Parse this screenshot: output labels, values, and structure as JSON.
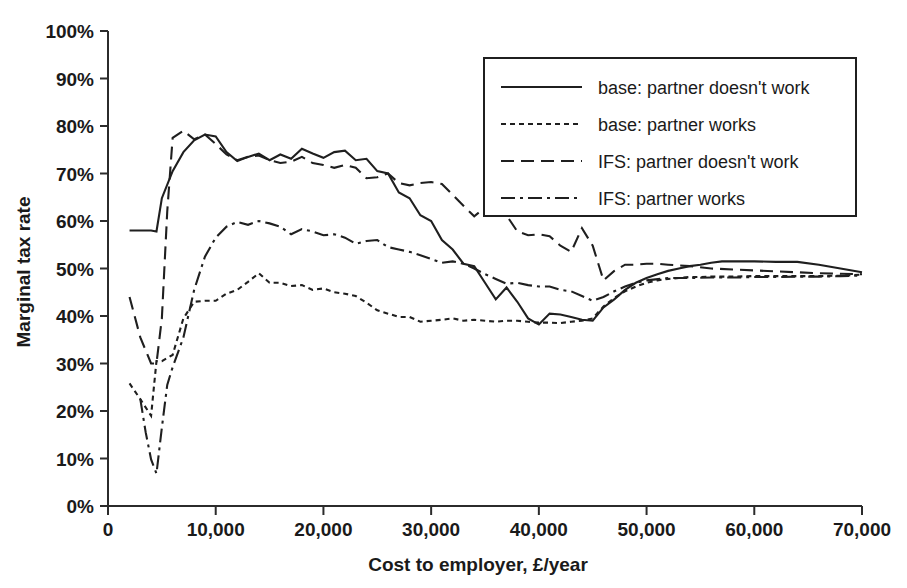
{
  "chart_data": {
    "type": "line",
    "title": "",
    "xlabel": "Cost to employer, £/year",
    "ylabel": "Marginal tax rate",
    "xlim": [
      0,
      70000
    ],
    "ylim": [
      0,
      1.0
    ],
    "grid": false,
    "legend_position": "top-right",
    "x_ticks": [
      0,
      10000,
      20000,
      30000,
      40000,
      50000,
      60000,
      70000
    ],
    "x_tick_labels": [
      "0",
      "10,000",
      "20,000",
      "30,000",
      "40,000",
      "50,000",
      "60,000",
      "70,000"
    ],
    "y_ticks": [
      0,
      0.1,
      0.2,
      0.3,
      0.4,
      0.5,
      0.6,
      0.7,
      0.8,
      0.9,
      1.0
    ],
    "y_tick_labels": [
      "0%",
      "10%",
      "20%",
      "30%",
      "40%",
      "50%",
      "60%",
      "70%",
      "80%",
      "90%",
      "100%"
    ],
    "series": [
      {
        "name": "base: partner doesn't work",
        "dash_style": "solid",
        "dash_array": "",
        "x": [
          2000,
          3000,
          4000,
          4500,
          5000,
          6000,
          7000,
          8000,
          9000,
          10000,
          11000,
          12000,
          13000,
          14000,
          15000,
          16000,
          17000,
          18000,
          19000,
          20000,
          21000,
          22000,
          23000,
          24000,
          25000,
          26000,
          27000,
          28000,
          29000,
          30000,
          31000,
          32000,
          33000,
          34000,
          35000,
          36000,
          37000,
          38000,
          39000,
          40000,
          41000,
          42000,
          43000,
          44000,
          45000,
          46000,
          47000,
          48000,
          49000,
          50000,
          51000,
          52000,
          53000,
          54000,
          55000,
          56000,
          57000,
          58000,
          60000,
          62000,
          64000,
          66000,
          68000,
          70000
        ],
        "y": [
          0.58,
          0.58,
          0.58,
          0.578,
          0.648,
          0.705,
          0.745,
          0.77,
          0.782,
          0.778,
          0.745,
          0.726,
          0.735,
          0.742,
          0.728,
          0.74,
          0.731,
          0.752,
          0.742,
          0.733,
          0.745,
          0.748,
          0.728,
          0.731,
          0.705,
          0.7,
          0.66,
          0.648,
          0.612,
          0.6,
          0.56,
          0.54,
          0.51,
          0.505,
          0.47,
          0.435,
          0.46,
          0.43,
          0.395,
          0.382,
          0.405,
          0.403,
          0.398,
          0.392,
          0.39,
          0.418,
          0.435,
          0.455,
          0.47,
          0.48,
          0.488,
          0.495,
          0.5,
          0.505,
          0.508,
          0.512,
          0.515,
          0.515,
          0.515,
          0.514,
          0.514,
          0.508,
          0.5,
          0.492
        ]
      },
      {
        "name": "base: partner works",
        "dash_style": "dotted",
        "dash_array": "5,4",
        "x": [
          2000,
          3000,
          4000,
          4500,
          5000,
          6000,
          7000,
          8000,
          9000,
          10000,
          11000,
          12000,
          13000,
          14000,
          15000,
          16000,
          17000,
          18000,
          19000,
          20000,
          21000,
          22000,
          23000,
          24000,
          25000,
          26000,
          27000,
          28000,
          29000,
          30000,
          31000,
          32000,
          33000,
          34000,
          35000,
          36000,
          37000,
          38000,
          39000,
          40000,
          41000,
          42000,
          43000,
          44000,
          45000,
          46000,
          47000,
          48000,
          49000,
          50000,
          51000,
          52000,
          53000,
          54000,
          55000,
          56000,
          58000,
          60000,
          62000,
          64000,
          66000,
          68000,
          70000
        ],
        "y": [
          0.258,
          0.225,
          0.19,
          0.305,
          0.305,
          0.318,
          0.395,
          0.43,
          0.432,
          0.432,
          0.447,
          0.455,
          0.472,
          0.49,
          0.47,
          0.47,
          0.463,
          0.465,
          0.455,
          0.458,
          0.45,
          0.447,
          0.442,
          0.428,
          0.412,
          0.405,
          0.398,
          0.398,
          0.388,
          0.39,
          0.392,
          0.395,
          0.39,
          0.392,
          0.39,
          0.388,
          0.39,
          0.39,
          0.388,
          0.386,
          0.386,
          0.385,
          0.388,
          0.39,
          0.395,
          0.42,
          0.438,
          0.452,
          0.462,
          0.47,
          0.475,
          0.478,
          0.48,
          0.482,
          0.482,
          0.483,
          0.483,
          0.484,
          0.484,
          0.484,
          0.484,
          0.485,
          0.487
        ]
      },
      {
        "name": "IFS: partner doesn't work",
        "dash_style": "dashed",
        "dash_array": "13,7",
        "x": [
          2000,
          3000,
          4000,
          4500,
          5000,
          5500,
          6000,
          7000,
          8000,
          9000,
          10000,
          11000,
          12000,
          13000,
          14000,
          15000,
          16000,
          17000,
          18000,
          19000,
          20000,
          21000,
          22000,
          23000,
          24000,
          25000,
          26000,
          27000,
          28000,
          29000,
          30000,
          31000,
          32000,
          33000,
          34000,
          35000,
          36000,
          37000,
          38000,
          39000,
          40000,
          41000,
          42000,
          43000,
          44000,
          45000,
          46000,
          47000,
          48000,
          49000,
          50000,
          51000,
          52000,
          54000,
          56000,
          58000,
          60000,
          62000,
          64000,
          66000,
          68000,
          70000
        ],
        "y": [
          0.44,
          0.355,
          0.3,
          0.3,
          0.395,
          0.62,
          0.775,
          0.79,
          0.772,
          0.782,
          0.762,
          0.74,
          0.728,
          0.735,
          0.738,
          0.728,
          0.722,
          0.725,
          0.735,
          0.722,
          0.718,
          0.712,
          0.718,
          0.712,
          0.69,
          0.692,
          0.7,
          0.68,
          0.675,
          0.68,
          0.682,
          0.678,
          0.655,
          0.632,
          0.61,
          0.628,
          0.648,
          0.612,
          0.578,
          0.57,
          0.572,
          0.568,
          0.548,
          0.535,
          0.585,
          0.548,
          0.475,
          0.495,
          0.508,
          0.508,
          0.51,
          0.51,
          0.508,
          0.505,
          0.5,
          0.498,
          0.496,
          0.494,
          0.492,
          0.49,
          0.489,
          0.488
        ]
      },
      {
        "name": "IFS: partner works",
        "dash_style": "dashdot",
        "dash_array": "14,5,3,5",
        "x": [
          3000,
          3500,
          4000,
          4500,
          5000,
          5500,
          6000,
          7000,
          8000,
          9000,
          10000,
          11000,
          12000,
          13000,
          14000,
          15000,
          16000,
          17000,
          18000,
          19000,
          20000,
          21000,
          22000,
          23000,
          24000,
          25000,
          26000,
          27000,
          28000,
          29000,
          30000,
          31000,
          32000,
          33000,
          34000,
          35000,
          36000,
          37000,
          38000,
          39000,
          40000,
          41000,
          42000,
          43000,
          44000,
          45000,
          46000,
          47000,
          48000,
          49000,
          50000,
          52000,
          54000,
          56000,
          58000,
          60000,
          62000,
          64000,
          66000,
          68000,
          70000
        ],
        "y": [
          0.225,
          0.155,
          0.098,
          0.068,
          0.165,
          0.255,
          0.292,
          0.355,
          0.455,
          0.525,
          0.565,
          0.588,
          0.598,
          0.592,
          0.6,
          0.595,
          0.588,
          0.572,
          0.583,
          0.578,
          0.57,
          0.572,
          0.565,
          0.552,
          0.558,
          0.56,
          0.545,
          0.54,
          0.535,
          0.528,
          0.52,
          0.512,
          0.515,
          0.51,
          0.5,
          0.488,
          0.478,
          0.468,
          0.47,
          0.465,
          0.462,
          0.462,
          0.455,
          0.452,
          0.442,
          0.432,
          0.44,
          0.452,
          0.462,
          0.47,
          0.475,
          0.48,
          0.48,
          0.481,
          0.481,
          0.482,
          0.482,
          0.483,
          0.483,
          0.484,
          0.485
        ]
      }
    ],
    "legend_entries": [
      "base: partner doesn't work",
      "base: partner works",
      "IFS: partner doesn't work",
      "IFS: partner works"
    ]
  },
  "colors": {
    "line": "#1f1f1f",
    "axis": "#2b2b2b",
    "text": "#1a1a1a",
    "background": "#ffffff"
  }
}
